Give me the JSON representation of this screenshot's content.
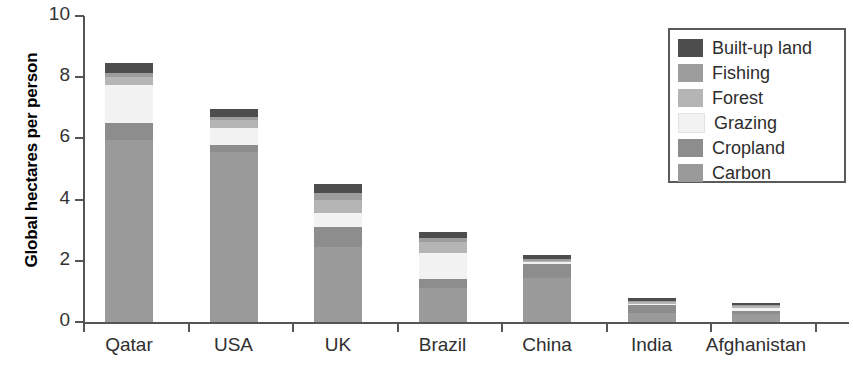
{
  "chart_data": {
    "type": "bar",
    "title": "",
    "subtitle": "",
    "xlabel": "",
    "ylabel": "Global hectares per person",
    "ylim": [
      0,
      10
    ],
    "yticks": [
      0,
      2,
      4,
      6,
      8,
      10
    ],
    "grid": false,
    "stacked": true,
    "legend_position": "top-right",
    "categories": [
      "Qatar",
      "USA",
      "UK",
      "Brazil",
      "China",
      "India",
      "Afghanistan"
    ],
    "series": [
      {
        "name": "Carbon",
        "color": "#9a9a9a",
        "values": [
          5.95,
          5.55,
          2.45,
          1.1,
          1.45,
          0.3,
          0.25
        ]
      },
      {
        "name": "Cropland",
        "color": "#8d8d8d",
        "values": [
          0.55,
          0.25,
          0.65,
          0.3,
          0.45,
          0.25,
          0.1
        ]
      },
      {
        "name": "Grazing",
        "color": "#f2f2f2",
        "values": [
          1.25,
          0.55,
          0.45,
          0.85,
          0.05,
          0.05,
          0.1
        ]
      },
      {
        "name": "Forest",
        "color": "#b5b5b5",
        "values": [
          0.25,
          0.25,
          0.45,
          0.35,
          0.05,
          0.05,
          0.1
        ]
      },
      {
        "name": "Fishing",
        "color": "#9d9d9d",
        "values": [
          0.15,
          0.1,
          0.2,
          0.15,
          0.05,
          0.03,
          0.02
        ]
      },
      {
        "name": "Built-up land",
        "color": "#4d4d4d",
        "values": [
          0.3,
          0.25,
          0.3,
          0.2,
          0.15,
          0.1,
          0.05
        ]
      }
    ],
    "totals": [
      8.45,
      6.95,
      4.5,
      2.95,
      2.2,
      0.78,
      0.62
    ]
  },
  "axes": {
    "y_title": "Global hectares per person",
    "y_tick_labels": [
      "0",
      "2",
      "4",
      "6",
      "8",
      "10"
    ],
    "x_tick_labels": [
      "Qatar",
      "USA",
      "UK",
      "Brazil",
      "China",
      "India",
      "Afghanistan"
    ]
  },
  "legend": {
    "items": [
      {
        "label": "Built-up land",
        "color": "#4d4d4d"
      },
      {
        "label": "Fishing",
        "color": "#9d9d9d"
      },
      {
        "label": "Forest",
        "color": "#b5b5b5"
      },
      {
        "label": "Grazing",
        "color": "#f2f2f2"
      },
      {
        "label": "Cropland",
        "color": "#8d8d8d"
      },
      {
        "label": "Carbon",
        "color": "#9a9a9a"
      }
    ]
  },
  "colors": {
    "axis": "#555555",
    "text": "#2f2f2f",
    "background": "#ffffff"
  }
}
